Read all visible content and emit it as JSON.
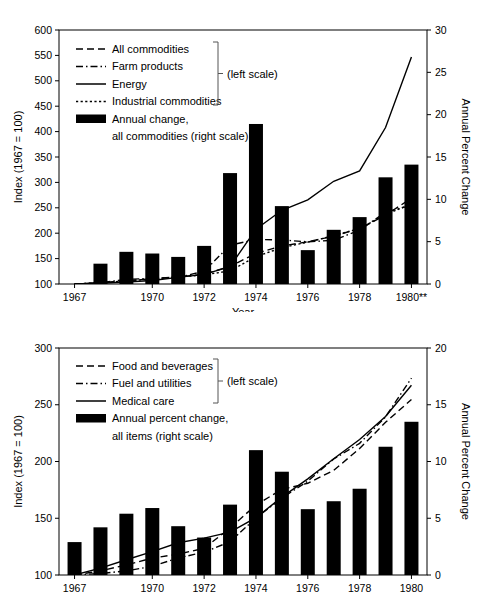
{
  "figure": {
    "title": "",
    "panels": [
      "producer-price-index-chart",
      "consumer-price-index-chart"
    ]
  },
  "chart_data": [
    {
      "id": "top",
      "type": "bar",
      "title": "",
      "subtitle": "",
      "xlabel": "Year",
      "ylabel": "Index (1967 = 100)",
      "y2label": "Annual Percent Change",
      "grid": false,
      "legend_position": "upper-left",
      "left_scale_note": "(left scale)",
      "xlim": [
        1966.4,
        1980.6
      ],
      "ylim": [
        100,
        600
      ],
      "y2lim": [
        0,
        30
      ],
      "yticks": [
        100,
        150,
        200,
        250,
        300,
        350,
        400,
        450,
        500,
        550,
        600
      ],
      "y2ticks": [
        0,
        5,
        10,
        15,
        20,
        25,
        30
      ],
      "xticks": [
        1967,
        1970,
        1972,
        1974,
        1976,
        1978,
        1980
      ],
      "xticklabels": [
        "1967",
        "1970",
        "1972",
        "1974",
        "1976",
        "1978",
        "1980**"
      ],
      "bars": {
        "name": "Annual change, all commodities (right scale)",
        "scale": "right",
        "x": [
          1968,
          1969,
          1970,
          1971,
          1972,
          1973,
          1974,
          1975,
          1976,
          1977,
          1978,
          1979,
          1980
        ],
        "values": [
          2.4,
          3.8,
          3.6,
          3.2,
          4.5,
          13.1,
          18.9,
          9.2,
          4.0,
          6.4,
          7.9,
          12.6,
          14.1
        ]
      },
      "series": [
        {
          "name": "All commodities",
          "style": "dashed",
          "scale": "left",
          "x": [
            1967,
            1968,
            1969,
            1970,
            1971,
            1972,
            1973,
            1974,
            1975,
            1976,
            1977,
            1978,
            1979,
            1980
          ],
          "values": [
            100,
            102.5,
            106.5,
            110.4,
            114.0,
            119.1,
            134.7,
            160.1,
            174.9,
            183.0,
            194.2,
            209.3,
            235.6,
            268.8
          ]
        },
        {
          "name": "Farm products",
          "style": "dashdot",
          "scale": "left",
          "x": [
            1967,
            1968,
            1969,
            1970,
            1971,
            1972,
            1973,
            1974,
            1975,
            1976,
            1977,
            1978,
            1979,
            1980
          ],
          "values": [
            100,
            102.5,
            109.1,
            111.0,
            112.9,
            125.0,
            176.3,
            187.7,
            186.7,
            183.0,
            186.1,
            206.0,
            241.4,
            255.0
          ]
        },
        {
          "name": "Energy",
          "style": "solid",
          "scale": "left",
          "x": [
            1967,
            1968,
            1969,
            1970,
            1971,
            1972,
            1973,
            1974,
            1975,
            1976,
            1977,
            1978,
            1979,
            1980
          ],
          "values": [
            100,
            101.5,
            104.0,
            107.0,
            113.0,
            119.0,
            134.3,
            208.0,
            245.1,
            265.6,
            302.2,
            322.5,
            408.1,
            547.0
          ]
        },
        {
          "name": "Industrial commodities",
          "style": "dotted",
          "scale": "left",
          "x": [
            1967,
            1968,
            1969,
            1970,
            1971,
            1972,
            1973,
            1974,
            1975,
            1976,
            1977,
            1978,
            1979,
            1980
          ],
          "values": [
            100,
            102.5,
            106.0,
            110.0,
            114.0,
            117.9,
            125.9,
            153.8,
            171.5,
            182.4,
            195.1,
            209.4,
            236.5,
            258.0
          ]
        }
      ]
    },
    {
      "id": "bottom",
      "type": "bar",
      "title": "",
      "subtitle": "",
      "xlabel": "",
      "ylabel": "Index (1967 = 100)",
      "y2label": "Annual Percent Change",
      "grid": false,
      "legend_position": "upper-left",
      "left_scale_note": "(left scale)",
      "xlim": [
        1966.4,
        1980.6
      ],
      "ylim": [
        100,
        300
      ],
      "y2lim": [
        0,
        20
      ],
      "yticks": [
        100,
        150,
        200,
        250,
        300
      ],
      "y2ticks": [
        0,
        5,
        10,
        15,
        20
      ],
      "xticks": [
        1967,
        1970,
        1972,
        1974,
        1976,
        1978,
        1980
      ],
      "xticklabels": [
        "1967",
        "1970",
        "1972",
        "1974",
        "1976",
        "1978",
        "1980"
      ],
      "bars": {
        "name": "Annual percent change, all items (right scale)",
        "scale": "right",
        "x": [
          1967,
          1968,
          1969,
          1970,
          1971,
          1972,
          1973,
          1974,
          1975,
          1976,
          1977,
          1978,
          1979,
          1980
        ],
        "values": [
          2.9,
          4.2,
          5.4,
          5.9,
          4.3,
          3.3,
          6.2,
          11.0,
          9.1,
          5.8,
          6.5,
          7.6,
          11.3,
          13.5
        ]
      },
      "series": [
        {
          "name": "Food and beverages",
          "style": "dashed",
          "scale": "left",
          "x": [
            1967,
            1968,
            1969,
            1970,
            1971,
            1972,
            1973,
            1974,
            1975,
            1976,
            1977,
            1978,
            1979,
            1980
          ],
          "values": [
            100,
            103.6,
            108.9,
            114.9,
            118.4,
            123.5,
            141.4,
            161.7,
            175.4,
            180.8,
            192.2,
            211.4,
            234.5,
            254.6
          ]
        },
        {
          "name": "Fuel and utilities",
          "style": "dashdot",
          "scale": "left",
          "x": [
            1967,
            1968,
            1969,
            1970,
            1971,
            1972,
            1973,
            1974,
            1975,
            1976,
            1977,
            1978,
            1979,
            1980
          ],
          "values": [
            100,
            101.3,
            103.6,
            107.6,
            115.0,
            120.1,
            129.3,
            150.2,
            167.8,
            182.7,
            202.2,
            216.0,
            239.3,
            273.5
          ]
        },
        {
          "name": "Medical care",
          "style": "solid",
          "scale": "left",
          "x": [
            1967,
            1968,
            1969,
            1970,
            1971,
            1972,
            1973,
            1974,
            1975,
            1976,
            1977,
            1978,
            1979,
            1980
          ],
          "values": [
            100,
            106.1,
            113.4,
            120.6,
            128.4,
            132.5,
            137.7,
            150.5,
            168.6,
            184.7,
            202.4,
            219.4,
            239.7,
            267.2
          ]
        }
      ]
    }
  ],
  "top_chart": {
    "ylabel": "Index (1967 = 100)",
    "y2label": "Annual Percent Change",
    "xlabel": "Year",
    "left_scale_note": "(left scale)",
    "legend": [
      {
        "label": "All commodities",
        "style": "dashed"
      },
      {
        "label": "Farm products",
        "style": "dashdot"
      },
      {
        "label": "Energy",
        "style": "solid"
      },
      {
        "label": "Industrial commodities",
        "style": "dotted"
      },
      {
        "label": "Annual change,",
        "style": "bar"
      },
      {
        "label": "all commodities (right scale)",
        "style": "bar-cont"
      }
    ],
    "yticklabels": [
      "600",
      "550",
      "500",
      "450",
      "400",
      "350",
      "300",
      "250",
      "200",
      "150",
      "100"
    ],
    "y2ticklabels": [
      "30",
      "25",
      "20",
      "15",
      "10",
      "5",
      "0"
    ],
    "xticklabels": [
      "1967",
      "1970",
      "1972",
      "1974",
      "1976",
      "1978",
      "1980**"
    ]
  },
  "bottom_chart": {
    "ylabel": "Index (1967 = 100)",
    "y2label": "Annual Percent Change",
    "xlabel": "",
    "left_scale_note": "(left scale)",
    "legend": [
      {
        "label": "Food and beverages",
        "style": "dashed"
      },
      {
        "label": "Fuel and utilities",
        "style": "dashdot"
      },
      {
        "label": "Medical care",
        "style": "solid"
      },
      {
        "label": "Annual percent change,",
        "style": "bar"
      },
      {
        "label": "all items (right scale)",
        "style": "bar-cont"
      }
    ],
    "yticklabels": [
      "300",
      "250",
      "200",
      "150",
      "100"
    ],
    "y2ticklabels": [
      "20",
      "15",
      "10",
      "5",
      "0"
    ],
    "xticklabels": [
      "1967",
      "1970",
      "1972",
      "1974",
      "1976",
      "1978",
      "1980"
    ]
  },
  "colors": {
    "ink": "#000000",
    "background": "#ffffff",
    "bracket": "#555555"
  }
}
